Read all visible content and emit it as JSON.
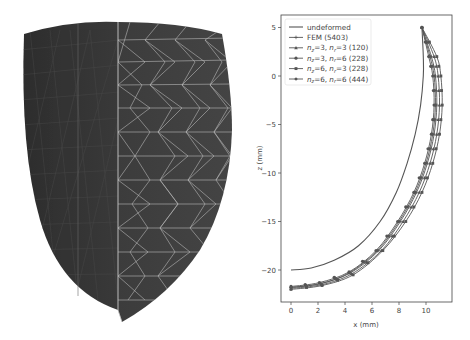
{
  "figure": {
    "left_panel": {
      "description": "3D rendered tetrahedral mesh of a truncated ellipsoid (left ventricle-like shape), half shown with wireframe",
      "fill_color": "#3a3a3a",
      "wire_color": "#b8b8b8"
    }
  },
  "chart_data": {
    "type": "line",
    "title": "",
    "xlabel": "x (mm)",
    "ylabel": "z (mm)",
    "xlim": [
      -0.8,
      11.7
    ],
    "ylim": [
      -23,
      6.2
    ],
    "xticks": [
      0,
      2,
      4,
      6,
      8,
      10
    ],
    "yticks": [
      5,
      0,
      -5,
      -10,
      -15,
      -20
    ],
    "grid": false,
    "legend_position": "upper left",
    "series": [
      {
        "name": "undeformed",
        "marker": "none",
        "x": [
          9.7,
          9.8,
          9.8,
          9.6,
          9.2,
          8.6,
          7.8,
          6.6,
          5.0,
          3.2,
          1.5,
          0
        ],
        "y": [
          5,
          2,
          0,
          -3,
          -6,
          -9,
          -12,
          -15,
          -17.5,
          -19,
          -19.8,
          -20
        ]
      },
      {
        "name": "FEM (5403)",
        "marker": "+",
        "x": [
          9.7,
          10.4,
          10.7,
          10.8,
          10.6,
          10.1,
          9.3,
          8.1,
          6.5,
          4.4,
          2.2,
          0
        ],
        "y": [
          5,
          2,
          0,
          -3,
          -6,
          -9,
          -12,
          -15,
          -18,
          -20.3,
          -21.4,
          -21.8
        ]
      },
      {
        "name": "n_z=3, n_r=3 (120)",
        "marker": "^",
        "x": [
          9.7,
          10.6,
          10.9,
          11.0,
          10.8,
          10.3,
          9.5,
          8.3,
          6.7,
          4.5,
          2.3,
          0
        ],
        "y": [
          5,
          2,
          0,
          -3,
          -6,
          -9,
          -12,
          -15,
          -18,
          -20.4,
          -21.5,
          -21.9
        ]
      },
      {
        "name": "n_z=3, n_r=6 (228)",
        "marker": "o",
        "x": [
          9.7,
          10.2,
          10.5,
          10.6,
          10.4,
          9.9,
          9.1,
          7.9,
          6.3,
          4.3,
          2.1,
          0
        ],
        "y": [
          5,
          2,
          0,
          -3,
          -6,
          -9,
          -12,
          -15,
          -18,
          -20.2,
          -21.3,
          -21.7
        ]
      },
      {
        "name": "n_z=6, n_r=3 (228)",
        "marker": "s",
        "x": [
          9.7,
          10.8,
          11.1,
          11.2,
          11.0,
          10.5,
          9.7,
          8.5,
          6.8,
          4.6,
          2.3,
          0
        ],
        "y": [
          5,
          2,
          0,
          -3,
          -6,
          -9,
          -12,
          -15,
          -18,
          -20.5,
          -21.6,
          -22.0
        ]
      },
      {
        "name": "n_z=6, n_r=6 (444)",
        "marker": "D",
        "x": [
          9.7,
          10.3,
          10.6,
          10.7,
          10.5,
          10.0,
          9.2,
          8.0,
          6.4,
          4.3,
          2.2,
          0
        ],
        "y": [
          5,
          2,
          0,
          -3,
          -6,
          -9,
          -12,
          -15,
          -18,
          -20.3,
          -21.4,
          -21.8
        ]
      }
    ]
  },
  "legend": [
    {
      "label": "undeformed"
    },
    {
      "label": "FEM (5403)"
    },
    {
      "label_parts": [
        "n",
        "z",
        "=3, ",
        "n",
        "r",
        "=3 (120)"
      ]
    },
    {
      "label_parts": [
        "n",
        "z",
        "=3, ",
        "n",
        "r",
        "=6 (228)"
      ]
    },
    {
      "label_parts": [
        "n",
        "z",
        "=6, ",
        "n",
        "r",
        "=3 (228)"
      ]
    },
    {
      "label_parts": [
        "n",
        "z",
        "=6, ",
        "n",
        "r",
        "=6 (444)"
      ]
    }
  ],
  "axes": {
    "xlabel": "x (mm)",
    "ylabel": "z (mm)",
    "xticks": [
      "0",
      "2",
      "4",
      "6",
      "8",
      "10"
    ],
    "yticks": [
      "5",
      "0",
      "−5",
      "−10",
      "−15",
      "−20"
    ]
  },
  "colors": {
    "line": "#555555",
    "axis": "#444444",
    "legend_border": "#dddddd"
  }
}
